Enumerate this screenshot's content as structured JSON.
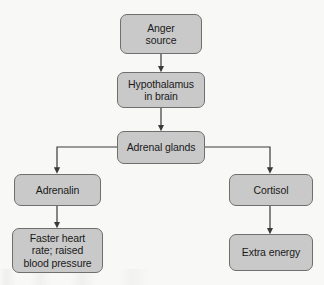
{
  "diagram": {
    "type": "flowchart",
    "colors": {
      "node_fill": "#c9c9c9",
      "node_border": "#6f6f6f",
      "connector": "#3a3a3a",
      "background": "#f8f8f6",
      "text": "#1a1a1a"
    },
    "nodes": [
      {
        "id": "anger-source",
        "label": "Anger\nsource",
        "x": 120,
        "y": 14,
        "w": 82,
        "h": 40
      },
      {
        "id": "hypothalamus",
        "label": "Hypothalamus\nin brain",
        "x": 117,
        "y": 72,
        "w": 88,
        "h": 36
      },
      {
        "id": "adrenal-glands",
        "label": "Adrenal glands",
        "x": 117,
        "y": 131,
        "w": 88,
        "h": 33
      },
      {
        "id": "adrenalin",
        "label": "Adrenalin",
        "x": 14,
        "y": 174,
        "w": 87,
        "h": 32
      },
      {
        "id": "cortisol",
        "label": "Cortisol",
        "x": 229,
        "y": 174,
        "w": 84,
        "h": 32
      },
      {
        "id": "faster-heart-rate",
        "label": "Faster heart\nrate; raised\nblood pressure",
        "x": 12,
        "y": 228,
        "w": 91,
        "h": 45
      },
      {
        "id": "extra-energy",
        "label": "Extra energy",
        "x": 229,
        "y": 234,
        "w": 84,
        "h": 37
      }
    ],
    "edges": [
      {
        "id": "anger-to-hypothalamus",
        "from": "anger-source",
        "to": "hypothalamus",
        "shape": "straight-down"
      },
      {
        "id": "hypothalamus-to-adrenal",
        "from": "hypothalamus",
        "to": "adrenal-glands",
        "shape": "straight-down"
      },
      {
        "id": "adrenal-to-adrenalin",
        "from": "adrenal-glands",
        "to": "adrenalin",
        "shape": "elbow-left"
      },
      {
        "id": "adrenal-to-cortisol",
        "from": "adrenal-glands",
        "to": "cortisol",
        "shape": "elbow-right"
      },
      {
        "id": "adrenalin-to-heart-rate",
        "from": "adrenalin",
        "to": "faster-heart-rate",
        "shape": "straight-down"
      },
      {
        "id": "cortisol-to-extra-energy",
        "from": "cortisol",
        "to": "extra-energy",
        "shape": "straight-down"
      }
    ]
  }
}
